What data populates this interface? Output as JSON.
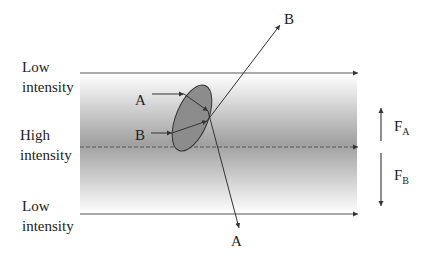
{
  "diagram": {
    "title": "",
    "labels": {
      "top_low": [
        "Low",
        "intensity"
      ],
      "middle_high": [
        "High",
        "intensity"
      ],
      "bottom_low": [
        "Low",
        "intensity"
      ]
    },
    "rays": {
      "a_in": "A",
      "b_in": "B",
      "a_out": "A",
      "b_out": "B"
    },
    "forces": {
      "fa": {
        "main": "F",
        "sub": "A",
        "direction": "up"
      },
      "fb": {
        "main": "F",
        "sub": "B",
        "direction": "down"
      }
    },
    "colors": {
      "band_dark": "#a0a0a0",
      "band_light": "#ffffff",
      "particle": "#8c8c8c",
      "line": "#555555"
    }
  }
}
